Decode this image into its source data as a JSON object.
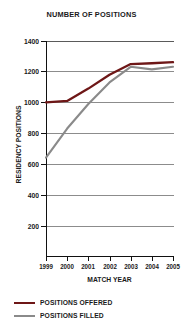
{
  "chart_data": {
    "type": "line",
    "title": "NUMBER OF POSITIONS",
    "xlabel": "MATCH YEAR",
    "ylabel": "RESIDENCY POSITIONS",
    "categories": [
      "1999",
      "2000",
      "2001",
      "2002",
      "2003",
      "2004",
      "2005"
    ],
    "x": [
      1999,
      2000,
      2001,
      2002,
      2003,
      2004,
      2005
    ],
    "ylim": [
      0,
      1400
    ],
    "yticks": [
      200,
      400,
      600,
      800,
      1000,
      1200,
      1400
    ],
    "ytick_labels": [
      "200",
      "400",
      "600",
      "800",
      "1000",
      "1200",
      "1400"
    ],
    "grid": true,
    "legend_position": "bottom-left",
    "series": [
      {
        "name": "POSITIONS OFFERED",
        "color": "#6e1717",
        "values": [
          1000,
          1010,
          1090,
          1180,
          1250,
          1255,
          1262
        ]
      },
      {
        "name": "POSITIONS FILLED",
        "color": "#8a8a8a",
        "values": [
          640,
          830,
          990,
          1130,
          1232,
          1215,
          1232
        ]
      }
    ]
  },
  "legend": {
    "items": [
      {
        "label": "POSITIONS OFFERED",
        "color": "#6e1717"
      },
      {
        "label": "POSITIONS FILLED",
        "color": "#8a8a8a"
      }
    ]
  }
}
